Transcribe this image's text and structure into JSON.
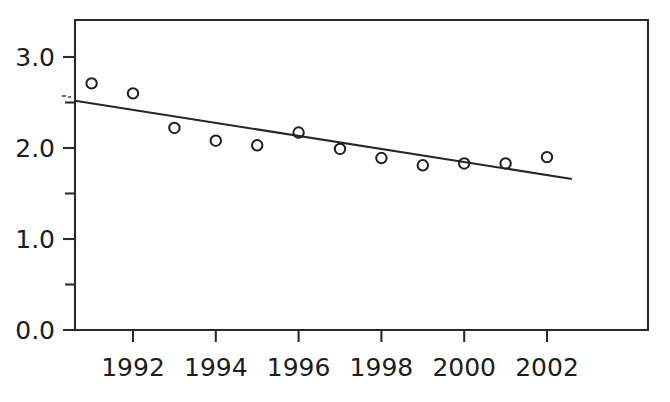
{
  "chart_data": {
    "type": "scatter",
    "title": "",
    "subtitle": "",
    "xlabel": "",
    "ylabel": "",
    "xlim": [
      1990.4,
      2002.6
    ],
    "ylim": [
      0.0,
      3.3
    ],
    "grid": false,
    "legend": false,
    "x_major_ticks": [
      1992,
      1994,
      1996,
      1998,
      2000,
      2002
    ],
    "x_tick_labels": [
      "1992",
      "1994",
      "1996",
      "1998",
      "2000",
      "2002"
    ],
    "y_major_ticks": [
      0.0,
      1.0,
      2.0,
      3.0
    ],
    "y_tick_labels": [
      "0.0",
      "1.0",
      "2.0",
      "3.0"
    ],
    "y_minor_ticks": [
      0.5,
      1.5,
      2.5
    ],
    "series": [
      {
        "name": "observed",
        "marker": "open-circle",
        "x": [
          1991,
          1992,
          1993,
          1994,
          1995,
          1996,
          1997,
          1998,
          1999,
          2000,
          2001,
          2002
        ],
        "values": [
          2.71,
          2.6,
          2.22,
          2.08,
          2.03,
          2.17,
          1.99,
          1.89,
          1.81,
          1.83,
          1.83,
          1.9
        ]
      },
      {
        "name": "trend-line",
        "type": "line",
        "x": [
          1990.6,
          2002.6
        ],
        "values": [
          2.52,
          1.66
        ]
      }
    ],
    "annotations": []
  },
  "axes": {
    "y_axis_name": "y-axis",
    "x_axis_name": "x-axis"
  }
}
